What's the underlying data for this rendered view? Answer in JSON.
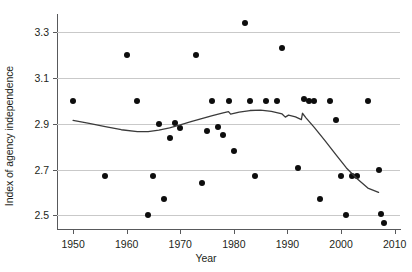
{
  "chart_data": {
    "type": "scatter",
    "title": "",
    "xlabel": "Year",
    "ylabel": "Index of agency independence",
    "xlim": [
      1947,
      2011
    ],
    "ylim": [
      2.44,
      3.38
    ],
    "grid": true,
    "legend": null,
    "xticks": [
      1950,
      1960,
      1970,
      1980,
      1990,
      2000,
      2010
    ],
    "yticks": [
      2.5,
      2.7,
      2.9,
      3.1,
      3.3
    ],
    "xtick_labels": [
      "1950",
      "1960",
      "1970",
      "1980",
      "1990",
      "2000",
      "2010"
    ],
    "ytick_labels": [
      "2.5",
      "2.7",
      "2.9",
      "3.1",
      "3.3"
    ],
    "point_color": "#0d0d0d",
    "line_color": "#3b3b3b",
    "grid_color": "#c9c9c9",
    "axis_color": "#58595b",
    "points": [
      {
        "x": 1950,
        "y": 3.0
      },
      {
        "x": 1956,
        "y": 2.67
      },
      {
        "x": 1960,
        "y": 3.2
      },
      {
        "x": 1962,
        "y": 3.0
      },
      {
        "x": 1964,
        "y": 2.5
      },
      {
        "x": 1965,
        "y": 2.67
      },
      {
        "x": 1966,
        "y": 2.9
      },
      {
        "x": 1967,
        "y": 2.57
      },
      {
        "x": 1968,
        "y": 2.84
      },
      {
        "x": 1969,
        "y": 2.905
      },
      {
        "x": 1970,
        "y": 2.88
      },
      {
        "x": 1973,
        "y": 3.2
      },
      {
        "x": 1974,
        "y": 2.64
      },
      {
        "x": 1975,
        "y": 2.87
      },
      {
        "x": 1976,
        "y": 3.0
      },
      {
        "x": 1977,
        "y": 2.885
      },
      {
        "x": 1978,
        "y": 2.85
      },
      {
        "x": 1979,
        "y": 3.0
      },
      {
        "x": 1980,
        "y": 2.78
      },
      {
        "x": 1982,
        "y": 3.34
      },
      {
        "x": 1983,
        "y": 3.0
      },
      {
        "x": 1984,
        "y": 2.67
      },
      {
        "x": 1986,
        "y": 3.0
      },
      {
        "x": 1988,
        "y": 3.0
      },
      {
        "x": 1989,
        "y": 3.23
      },
      {
        "x": 1992,
        "y": 2.705
      },
      {
        "x": 1993,
        "y": 3.01
      },
      {
        "x": 1994,
        "y": 3.0
      },
      {
        "x": 1995,
        "y": 3.0
      },
      {
        "x": 1996,
        "y": 2.57
      },
      {
        "x": 1998,
        "y": 3.0
      },
      {
        "x": 1999,
        "y": 2.915
      },
      {
        "x": 2000,
        "y": 2.67
      },
      {
        "x": 2001,
        "y": 2.5
      },
      {
        "x": 2002,
        "y": 2.67
      },
      {
        "x": 2003,
        "y": 2.67
      },
      {
        "x": 2005,
        "y": 3.0
      },
      {
        "x": 2007,
        "y": 2.7
      },
      {
        "x": 2007.5,
        "y": 2.505
      },
      {
        "x": 2008,
        "y": 2.465
      }
    ],
    "trend": [
      {
        "x": 1950,
        "y": 2.915
      },
      {
        "x": 1953,
        "y": 2.902
      },
      {
        "x": 1956,
        "y": 2.888
      },
      {
        "x": 1959,
        "y": 2.874
      },
      {
        "x": 1962,
        "y": 2.866
      },
      {
        "x": 1964,
        "y": 2.866
      },
      {
        "x": 1966,
        "y": 2.872
      },
      {
        "x": 1968,
        "y": 2.882
      },
      {
        "x": 1970,
        "y": 2.895
      },
      {
        "x": 1972,
        "y": 2.909
      },
      {
        "x": 1974,
        "y": 2.923
      },
      {
        "x": 1976,
        "y": 2.936
      },
      {
        "x": 1978,
        "y": 2.948
      },
      {
        "x": 1979,
        "y": 2.953
      },
      {
        "x": 1979.4,
        "y": 2.942
      },
      {
        "x": 1981,
        "y": 2.951
      },
      {
        "x": 1983,
        "y": 2.958
      },
      {
        "x": 1985,
        "y": 2.96
      },
      {
        "x": 1987,
        "y": 2.954
      },
      {
        "x": 1989,
        "y": 2.943
      },
      {
        "x": 1989.6,
        "y": 2.929
      },
      {
        "x": 1990.2,
        "y": 2.938
      },
      {
        "x": 1991.5,
        "y": 2.93
      },
      {
        "x": 1992.6,
        "y": 2.918
      },
      {
        "x": 1992.8,
        "y": 2.946
      },
      {
        "x": 1993.5,
        "y": 2.925
      },
      {
        "x": 1995,
        "y": 2.884
      },
      {
        "x": 1997,
        "y": 2.826
      },
      {
        "x": 1999,
        "y": 2.766
      },
      {
        "x": 2001,
        "y": 2.707
      },
      {
        "x": 2003,
        "y": 2.66
      },
      {
        "x": 2005,
        "y": 2.619
      },
      {
        "x": 2007,
        "y": 2.6
      }
    ]
  }
}
